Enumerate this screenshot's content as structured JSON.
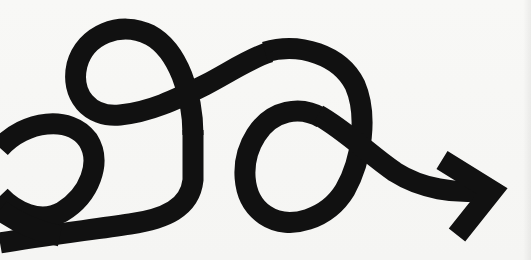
{
  "image": {
    "subject": "looping black arrow",
    "description": "A thick black line that winds through three loops from left to right, ending in an arrowhead pointing right",
    "colors": {
      "background": "#f7f7f5",
      "stroke": "#111111"
    },
    "stroke_width_px": 21,
    "loops": 3,
    "arrow_direction": "right"
  }
}
